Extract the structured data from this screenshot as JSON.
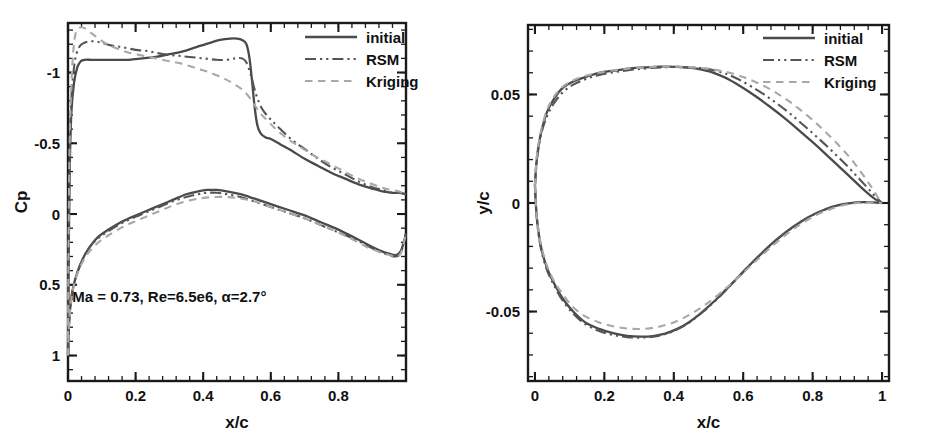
{
  "figure": {
    "background": "#ffffff",
    "panel_count": 2
  },
  "series_styles": {
    "initial": {
      "color": "#4a4a4a",
      "dash": "none",
      "width": 2.3
    },
    "rsm": {
      "color": "#555555",
      "dash": "dashdotdot",
      "width": 2.1
    },
    "kriging": {
      "color": "#a8a8a8",
      "dash": "dashed",
      "width": 2.1
    }
  },
  "legend": {
    "items": [
      {
        "key": "initial",
        "label": "initial"
      },
      {
        "key": "rsm",
        "label": "RSM"
      },
      {
        "key": "kriging",
        "label": "Kriging"
      }
    ]
  },
  "panels": {
    "cp": {
      "name": "pressure-coefficient-plot",
      "annotation": "Ma = 0.73, Re=6.5e6, α=2.7°",
      "xlabel": "x/c",
      "ylabel": "Cp",
      "xticklabels": [
        "0",
        "0.2",
        "0.4",
        "0.6",
        "0.8"
      ],
      "yticklabels": [
        "-1",
        "-0.5",
        "0",
        "0.5",
        "1"
      ]
    },
    "geometry": {
      "name": "airfoil-geometry-plot",
      "xlabel": "x/c",
      "ylabel": "y/c",
      "xticklabels": [
        "0",
        "0.2",
        "0.4",
        "0.6",
        "0.8",
        "1"
      ],
      "yticklabels": [
        "0.05",
        "0",
        "-0.05"
      ]
    }
  },
  "chart_data": [
    {
      "type": "line",
      "name": "cp-distribution",
      "title": "",
      "xlabel": "x/c",
      "ylabel": "Cp",
      "xlim": [
        0,
        1
      ],
      "ylim": [
        -1.35,
        1.18
      ],
      "y_inverted": true,
      "xticks": [
        0,
        0.2,
        0.4,
        0.6,
        0.8
      ],
      "yticks": [
        -1,
        -0.5,
        0,
        0.5,
        1
      ],
      "minor_tick_count": 4,
      "grid": false,
      "legend_position": "top-right",
      "annotations": [
        {
          "text": "Ma = 0.73, Re=6.5e6, α=2.7°",
          "x": 0.3,
          "y": 0.62
        }
      ],
      "series": [
        {
          "name": "initial",
          "surface": "upper",
          "x": [
            0.0,
            0.002,
            0.005,
            0.01,
            0.018,
            0.028,
            0.038,
            0.05,
            0.07,
            0.1,
            0.14,
            0.18,
            0.22,
            0.26,
            0.3,
            0.34,
            0.38,
            0.42,
            0.45,
            0.48,
            0.5,
            0.515,
            0.528,
            0.537,
            0.545,
            0.552,
            0.56,
            0.57,
            0.585,
            0.6,
            0.63,
            0.66,
            0.7,
            0.74,
            0.78,
            0.82,
            0.86,
            0.9,
            0.93,
            0.96,
            0.98,
            1.0
          ],
          "y": [
            1.0,
            0.32,
            -0.3,
            -0.72,
            -0.93,
            -1.04,
            -1.08,
            -1.09,
            -1.09,
            -1.09,
            -1.09,
            -1.09,
            -1.1,
            -1.11,
            -1.13,
            -1.15,
            -1.18,
            -1.21,
            -1.23,
            -1.24,
            -1.24,
            -1.23,
            -1.2,
            -1.1,
            -0.93,
            -0.76,
            -0.63,
            -0.57,
            -0.54,
            -0.53,
            -0.49,
            -0.45,
            -0.39,
            -0.34,
            -0.29,
            -0.25,
            -0.21,
            -0.18,
            -0.16,
            -0.15,
            -0.15,
            -0.14
          ]
        },
        {
          "name": "initial",
          "surface": "lower",
          "x": [
            0.0,
            0.003,
            0.008,
            0.016,
            0.028,
            0.045,
            0.065,
            0.09,
            0.12,
            0.155,
            0.19,
            0.23,
            0.27,
            0.31,
            0.35,
            0.385,
            0.41,
            0.44,
            0.47,
            0.51,
            0.55,
            0.6,
            0.65,
            0.7,
            0.75,
            0.8,
            0.85,
            0.89,
            0.925,
            0.95,
            0.97,
            0.985,
            1.0
          ],
          "y": [
            1.0,
            0.78,
            0.63,
            0.51,
            0.41,
            0.31,
            0.23,
            0.16,
            0.11,
            0.06,
            0.02,
            -0.02,
            -0.06,
            -0.1,
            -0.14,
            -0.16,
            -0.17,
            -0.17,
            -0.16,
            -0.14,
            -0.11,
            -0.07,
            -0.03,
            0.01,
            0.06,
            0.11,
            0.17,
            0.22,
            0.26,
            0.28,
            0.29,
            0.26,
            0.14
          ]
        },
        {
          "name": "rsm",
          "surface": "upper",
          "x": [
            0.0,
            0.002,
            0.005,
            0.01,
            0.018,
            0.026,
            0.036,
            0.048,
            0.062,
            0.08,
            0.1,
            0.13,
            0.16,
            0.2,
            0.24,
            0.28,
            0.32,
            0.36,
            0.4,
            0.44,
            0.47,
            0.495,
            0.515,
            0.528,
            0.54,
            0.55,
            0.56,
            0.575,
            0.595,
            0.62,
            0.66,
            0.7,
            0.74,
            0.78,
            0.82,
            0.86,
            0.9,
            0.93,
            0.96,
            0.98,
            1.0
          ],
          "y": [
            0.95,
            0.22,
            -0.42,
            -0.82,
            -1.04,
            -1.14,
            -1.19,
            -1.21,
            -1.22,
            -1.22,
            -1.21,
            -1.19,
            -1.18,
            -1.16,
            -1.15,
            -1.13,
            -1.12,
            -1.11,
            -1.1,
            -1.09,
            -1.09,
            -1.1,
            -1.1,
            -1.07,
            -0.99,
            -0.9,
            -0.82,
            -0.74,
            -0.68,
            -0.62,
            -0.53,
            -0.46,
            -0.39,
            -0.33,
            -0.28,
            -0.23,
            -0.19,
            -0.17,
            -0.15,
            -0.15,
            -0.14
          ]
        },
        {
          "name": "rsm",
          "surface": "lower",
          "x": [
            0.0,
            0.003,
            0.008,
            0.016,
            0.028,
            0.045,
            0.065,
            0.09,
            0.12,
            0.155,
            0.19,
            0.23,
            0.27,
            0.31,
            0.35,
            0.385,
            0.41,
            0.44,
            0.47,
            0.51,
            0.55,
            0.6,
            0.65,
            0.7,
            0.75,
            0.8,
            0.85,
            0.89,
            0.925,
            0.95,
            0.97,
            0.985,
            1.0
          ],
          "y": [
            1.0,
            0.78,
            0.63,
            0.51,
            0.41,
            0.31,
            0.23,
            0.17,
            0.12,
            0.07,
            0.03,
            -0.01,
            -0.05,
            -0.09,
            -0.12,
            -0.14,
            -0.15,
            -0.15,
            -0.14,
            -0.12,
            -0.09,
            -0.05,
            -0.01,
            0.03,
            0.08,
            0.13,
            0.18,
            0.23,
            0.27,
            0.29,
            0.3,
            0.27,
            0.14
          ]
        },
        {
          "name": "kriging",
          "surface": "upper",
          "x": [
            0.0,
            0.002,
            0.005,
            0.01,
            0.016,
            0.022,
            0.03,
            0.04,
            0.052,
            0.068,
            0.09,
            0.115,
            0.145,
            0.18,
            0.22,
            0.26,
            0.3,
            0.34,
            0.38,
            0.42,
            0.46,
            0.49,
            0.515,
            0.535,
            0.552,
            0.57,
            0.59,
            0.615,
            0.65,
            0.69,
            0.73,
            0.77,
            0.81,
            0.85,
            0.89,
            0.925,
            0.955,
            0.98,
            1.0
          ],
          "y": [
            0.88,
            0.12,
            -0.52,
            -0.92,
            -1.16,
            -1.27,
            -1.31,
            -1.32,
            -1.31,
            -1.28,
            -1.24,
            -1.2,
            -1.17,
            -1.14,
            -1.12,
            -1.1,
            -1.08,
            -1.06,
            -1.03,
            -1.0,
            -0.96,
            -0.92,
            -0.88,
            -0.83,
            -0.77,
            -0.71,
            -0.66,
            -0.6,
            -0.53,
            -0.47,
            -0.41,
            -0.36,
            -0.31,
            -0.26,
            -0.22,
            -0.19,
            -0.17,
            -0.16,
            -0.14
          ]
        },
        {
          "name": "kriging",
          "surface": "lower",
          "x": [
            0.0,
            0.003,
            0.008,
            0.016,
            0.028,
            0.045,
            0.065,
            0.09,
            0.12,
            0.155,
            0.19,
            0.23,
            0.27,
            0.31,
            0.35,
            0.39,
            0.43,
            0.47,
            0.51,
            0.55,
            0.6,
            0.65,
            0.7,
            0.75,
            0.8,
            0.85,
            0.89,
            0.925,
            0.95,
            0.972,
            0.986,
            1.0
          ],
          "y": [
            1.0,
            0.78,
            0.64,
            0.52,
            0.42,
            0.33,
            0.26,
            0.2,
            0.15,
            0.1,
            0.06,
            0.02,
            -0.02,
            -0.06,
            -0.09,
            -0.11,
            -0.12,
            -0.12,
            -0.11,
            -0.09,
            -0.05,
            -0.01,
            0.03,
            0.08,
            0.13,
            0.19,
            0.24,
            0.27,
            0.29,
            0.3,
            0.27,
            0.14
          ]
        }
      ]
    },
    {
      "type": "line",
      "name": "airfoil-geometry",
      "title": "",
      "xlabel": "x/c",
      "ylabel": "y/c",
      "xlim": [
        -0.02,
        1.02
      ],
      "ylim": [
        -0.082,
        0.082
      ],
      "y_inverted": false,
      "xticks": [
        0,
        0.2,
        0.4,
        0.6,
        0.8,
        1
      ],
      "yticks": [
        0.05,
        0,
        -0.05
      ],
      "minor_tick_count": 4,
      "grid": false,
      "legend_position": "top-right",
      "series": [
        {
          "name": "initial",
          "surface": "upper",
          "x": [
            0.0,
            0.004,
            0.01,
            0.02,
            0.035,
            0.055,
            0.08,
            0.11,
            0.145,
            0.185,
            0.23,
            0.275,
            0.32,
            0.365,
            0.41,
            0.45,
            0.48,
            0.505,
            0.53,
            0.56,
            0.6,
            0.64,
            0.68,
            0.72,
            0.76,
            0.8,
            0.84,
            0.88,
            0.92,
            0.955,
            0.98,
            1.0
          ],
          "y": [
            0.008,
            0.018,
            0.026,
            0.034,
            0.042,
            0.048,
            0.053,
            0.056,
            0.058,
            0.06,
            0.061,
            0.062,
            0.0625,
            0.0628,
            0.0627,
            0.0622,
            0.0615,
            0.0605,
            0.059,
            0.0568,
            0.053,
            0.0487,
            0.044,
            0.039,
            0.0336,
            0.028,
            0.0222,
            0.0162,
            0.0102,
            0.005,
            0.0018,
            0.0
          ]
        },
        {
          "name": "initial",
          "surface": "lower",
          "x": [
            0.0,
            0.004,
            0.01,
            0.02,
            0.035,
            0.055,
            0.08,
            0.11,
            0.145,
            0.185,
            0.225,
            0.265,
            0.305,
            0.34,
            0.375,
            0.41,
            0.445,
            0.485,
            0.525,
            0.565,
            0.61,
            0.655,
            0.7,
            0.745,
            0.79,
            0.835,
            0.88,
            0.92,
            0.95,
            0.975,
            1.0
          ],
          "y": [
            0.008,
            -0.004,
            -0.013,
            -0.022,
            -0.03,
            -0.037,
            -0.044,
            -0.05,
            -0.055,
            -0.058,
            -0.06,
            -0.0612,
            -0.0616,
            -0.0613,
            -0.0602,
            -0.058,
            -0.0548,
            -0.0498,
            -0.044,
            -0.0375,
            -0.03,
            -0.0228,
            -0.0163,
            -0.0108,
            -0.0063,
            -0.003,
            -0.0008,
            0.0002,
            0.0004,
            0.0003,
            0.0
          ]
        },
        {
          "name": "rsm",
          "surface": "upper",
          "x": [
            0.0,
            0.004,
            0.01,
            0.02,
            0.035,
            0.055,
            0.08,
            0.11,
            0.145,
            0.185,
            0.23,
            0.275,
            0.32,
            0.365,
            0.41,
            0.45,
            0.485,
            0.515,
            0.545,
            0.58,
            0.62,
            0.66,
            0.7,
            0.74,
            0.78,
            0.82,
            0.86,
            0.9,
            0.935,
            0.965,
            0.985,
            1.0
          ],
          "y": [
            0.008,
            0.017,
            0.025,
            0.033,
            0.04,
            0.046,
            0.051,
            0.0545,
            0.057,
            0.059,
            0.0603,
            0.0613,
            0.062,
            0.0625,
            0.0627,
            0.0625,
            0.062,
            0.0612,
            0.0598,
            0.0575,
            0.054,
            0.05,
            0.0455,
            0.0405,
            0.035,
            0.0293,
            0.0233,
            0.017,
            0.011,
            0.0058,
            0.0022,
            0.0
          ]
        },
        {
          "name": "rsm",
          "surface": "lower",
          "x": [
            0.0,
            0.004,
            0.01,
            0.02,
            0.035,
            0.055,
            0.08,
            0.11,
            0.145,
            0.185,
            0.225,
            0.265,
            0.305,
            0.34,
            0.375,
            0.41,
            0.445,
            0.485,
            0.525,
            0.565,
            0.61,
            0.655,
            0.7,
            0.745,
            0.79,
            0.835,
            0.88,
            0.92,
            0.95,
            0.975,
            1.0
          ],
          "y": [
            0.008,
            -0.004,
            -0.014,
            -0.023,
            -0.031,
            -0.038,
            -0.045,
            -0.051,
            -0.0558,
            -0.059,
            -0.0608,
            -0.0618,
            -0.062,
            -0.0616,
            -0.0604,
            -0.0582,
            -0.055,
            -0.05,
            -0.0442,
            -0.0377,
            -0.0302,
            -0.023,
            -0.0165,
            -0.011,
            -0.0064,
            -0.0031,
            -0.0009,
            0.0001,
            0.0004,
            0.0003,
            0.0
          ]
        },
        {
          "name": "kriging",
          "surface": "upper",
          "x": [
            0.0,
            0.004,
            0.01,
            0.02,
            0.035,
            0.055,
            0.08,
            0.11,
            0.145,
            0.185,
            0.23,
            0.275,
            0.32,
            0.365,
            0.41,
            0.45,
            0.49,
            0.525,
            0.56,
            0.6,
            0.64,
            0.68,
            0.72,
            0.76,
            0.8,
            0.84,
            0.88,
            0.915,
            0.945,
            0.97,
            0.988,
            1.0
          ],
          "y": [
            0.008,
            0.019,
            0.027,
            0.035,
            0.043,
            0.049,
            0.0535,
            0.0565,
            0.0585,
            0.06,
            0.0612,
            0.062,
            0.0625,
            0.0628,
            0.0628,
            0.0625,
            0.062,
            0.0612,
            0.06,
            0.058,
            0.0554,
            0.0522,
            0.0482,
            0.0435,
            0.0382,
            0.0323,
            0.0258,
            0.0194,
            0.013,
            0.0072,
            0.0026,
            0.0
          ]
        },
        {
          "name": "kriging",
          "surface": "lower",
          "x": [
            0.0,
            0.004,
            0.01,
            0.02,
            0.035,
            0.055,
            0.08,
            0.11,
            0.145,
            0.185,
            0.225,
            0.265,
            0.305,
            0.345,
            0.385,
            0.425,
            0.465,
            0.505,
            0.545,
            0.585,
            0.63,
            0.675,
            0.72,
            0.765,
            0.81,
            0.855,
            0.895,
            0.93,
            0.958,
            0.98,
            1.0
          ],
          "y": [
            0.008,
            -0.004,
            -0.013,
            -0.021,
            -0.029,
            -0.036,
            -0.042,
            -0.048,
            -0.0522,
            -0.055,
            -0.0568,
            -0.0578,
            -0.058,
            -0.0574,
            -0.0558,
            -0.0532,
            -0.0496,
            -0.0452,
            -0.04,
            -0.0343,
            -0.0277,
            -0.0211,
            -0.015,
            -0.0098,
            -0.0056,
            -0.0026,
            -0.0008,
            0.0,
            0.0002,
            0.0002,
            0.0
          ]
        }
      ]
    }
  ]
}
